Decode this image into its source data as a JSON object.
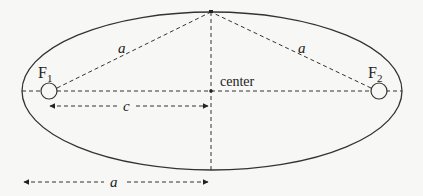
{
  "diagram": {
    "labels": {
      "focus1": "F",
      "focus1_sub": "1",
      "focus2": "F",
      "focus2_sub": "2",
      "center": "center",
      "a_upper_left": "a",
      "a_upper_right": "a",
      "c": "c",
      "a_bottom": "a"
    },
    "colors": {
      "background": "#f7f7f5",
      "stroke": "#333333"
    }
  }
}
